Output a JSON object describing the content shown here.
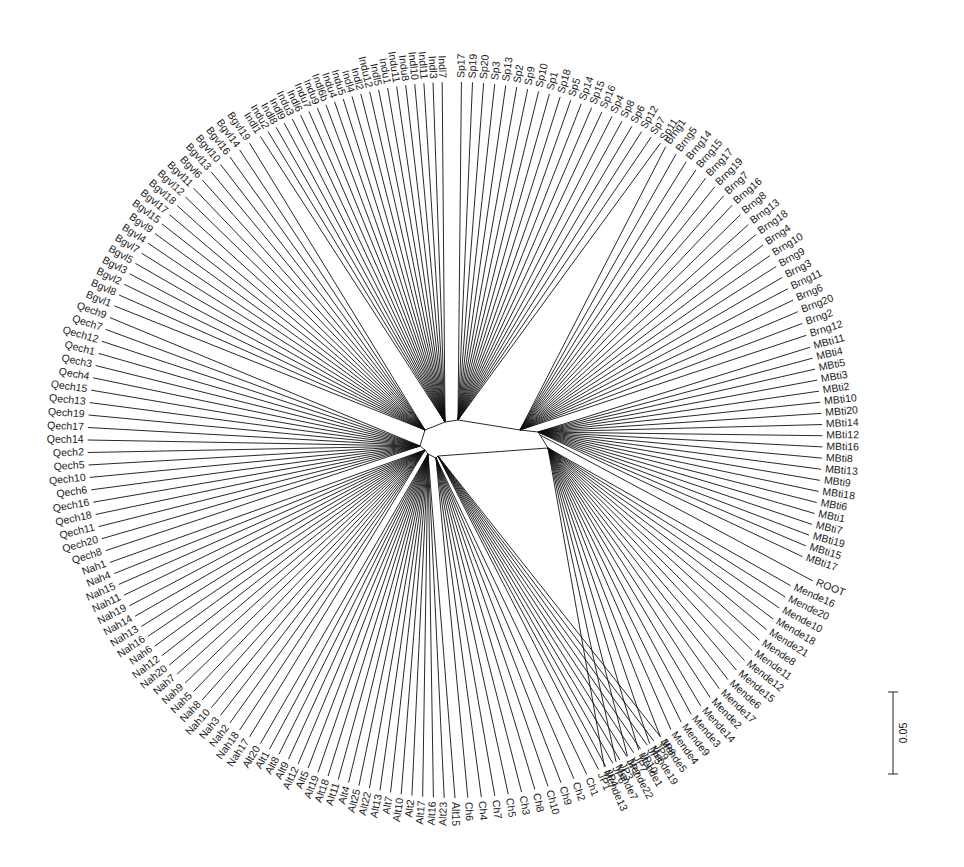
{
  "figure": {
    "type": "radial-phylogenetic-tree",
    "center": [
      455,
      440
    ],
    "scale_bar": {
      "label": "0.05",
      "x": 893,
      "y1": 692,
      "y2": 774
    },
    "root_label": "ROOT"
  },
  "clades": [
    {
      "name": "Sp",
      "hub": [
        458,
        420
      ],
      "start_deg": -89,
      "end_deg": -56,
      "leaves": [
        "Sp17",
        "Sp19",
        "Sp20",
        "Sp3",
        "Sp13",
        "Sp2",
        "Sp9",
        "Sp10",
        "Sp1",
        "Sp18",
        "Sp5",
        "Sp14",
        "Sp15",
        "Sp16",
        "Sp4",
        "Sp8",
        "Sp6",
        "Sp12",
        "Sp7",
        "Sp11"
      ]
    },
    {
      "name": "Brng",
      "hub": [
        520,
        430
      ],
      "start_deg": -55,
      "end_deg": -17,
      "leaves": [
        "Brng1",
        "Brng5",
        "Brng14",
        "Brng15",
        "Brng17",
        "Brng19",
        "Brng7",
        "Brng16",
        "Brng8",
        "Brng13",
        "Brng18",
        "Brng4",
        "Brng10",
        "Brng9",
        "Brng3",
        "Brng11",
        "Brng6",
        "Brng20",
        "Brng2",
        "Brng12"
      ]
    },
    {
      "name": "MBti",
      "hub": [
        538,
        432
      ],
      "start_deg": -15,
      "end_deg": 19,
      "leaves": [
        "MBti11",
        "MBti4",
        "MBti5",
        "MBti3",
        "MBti2",
        "MBti10",
        "MBti20",
        "MBti14",
        "MBti12",
        "MBti16",
        "MBti8",
        "MBti13",
        "MBti9",
        "MBti18",
        "MBti6",
        "MBti1",
        "MBti7",
        "MBti19",
        "MBti15",
        "MBti17"
      ]
    },
    {
      "name": "ROOT",
      "hub": [
        540,
        435
      ],
      "start_deg": 22,
      "end_deg": 22,
      "leaves": [
        "ROOT"
      ]
    },
    {
      "name": "Mende",
      "hub": [
        548,
        448
      ],
      "start_deg": 24,
      "end_deg": 66,
      "leaves": [
        "Mende16",
        "Mende20",
        "Mende10",
        "Mende18",
        "Mende21",
        "Mende8",
        "Mende11",
        "Mende12",
        "Mende15",
        "Mende6",
        "Mende17",
        "Mende2",
        "Mende14",
        "Mende3",
        "Mende9",
        "Mende4",
        "Mende5",
        "Mende19",
        "Mende1",
        "Mende22",
        "Mende7",
        "Mende13"
      ]
    },
    {
      "name": "JP",
      "hub": [
        438,
        456
      ],
      "start_deg": 56,
      "end_deg": 67,
      "leaves": [
        "JP8",
        "JP9",
        "JP5",
        "JP10",
        "JP7",
        "JP2",
        "JP3",
        "JP6",
        "JP4",
        "JP1"
      ]
    },
    {
      "name": "Ch",
      "hub": [
        436,
        458
      ],
      "start_deg": 69,
      "end_deg": 88,
      "leaves": [
        "Ch1",
        "Ch2",
        "Ch9",
        "Ch10",
        "Ch8",
        "Ch3",
        "Ch5",
        "Ch7",
        "Ch4",
        "Ch6"
      ]
    },
    {
      "name": "Alt",
      "hub": [
        428,
        454
      ],
      "start_deg": 90,
      "end_deg": 122,
      "leaves": [
        "Alt15",
        "Alt23",
        "Alt16",
        "Alt17",
        "Alt2",
        "Alt10",
        "Alt7",
        "Alt13",
        "Alt22",
        "Alt25",
        "Alt4",
        "Alt11",
        "Alt18",
        "Alt19",
        "Alt5",
        "Alt12",
        "Alt9",
        "Alt8",
        "Alt1",
        "Alt20"
      ]
    },
    {
      "name": "Nah",
      "hub": [
        425,
        450
      ],
      "start_deg": 124,
      "end_deg": 160,
      "leaves": [
        "Nah17",
        "Nah18",
        "Nah2",
        "Nah3",
        "Nah10",
        "Nah8",
        "Nah5",
        "Nah9",
        "Nah7",
        "Nah20",
        "Nah12",
        "Nah6",
        "Nah16",
        "Nah13",
        "Nah14",
        "Nah19",
        "Nah11",
        "Nah15",
        "Nah4",
        "Nah1"
      ]
    },
    {
      "name": "Qech",
      "hub": [
        420,
        446
      ],
      "start_deg": 162,
      "end_deg": 200,
      "leaves": [
        "Qech8",
        "Qech20",
        "Qech11",
        "Qech18",
        "Qech16",
        "Qech6",
        "Qech10",
        "Qech5",
        "Qech2",
        "Qech14",
        "Qech17",
        "Qech19",
        "Qech13",
        "Qech15",
        "Qech4",
        "Qech3",
        "Qech1",
        "Qech12",
        "Qech7",
        "Qech9"
      ]
    },
    {
      "name": "Bgvl",
      "hub": [
        425,
        430
      ],
      "start_deg": 202,
      "end_deg": 236,
      "leaves": [
        "Bgvl1",
        "Bgvl8",
        "Bgvl2",
        "Bgvl3",
        "Bgvl5",
        "Bgvl7",
        "Bgvl4",
        "Bgvl9",
        "Bgvl15",
        "Bgvl17",
        "Bgvl18",
        "Bgvl12",
        "Bgvl11",
        "Bgvl6",
        "Bgvl13",
        "Bgvl10",
        "Bgvl16",
        "Bgvl14",
        "Bgvl19"
      ]
    },
    {
      "name": "Indl/Indu",
      "hub": [
        445,
        422
      ],
      "start_deg": 238,
      "end_deg": 268,
      "leaves": [
        "Indl1",
        "Indu2",
        "Indl8",
        "Indl9",
        "Indu3",
        "Indl6",
        "Indu7",
        "Indu9",
        "Indl6b",
        "Indu4",
        "Indu5",
        "Indl4",
        "Indl2",
        "Indu12",
        "Indl5",
        "Indu1",
        "Indu11",
        "Indu8",
        "Indl10",
        "Indl11",
        "Indl3",
        "Indl7"
      ]
    }
  ]
}
